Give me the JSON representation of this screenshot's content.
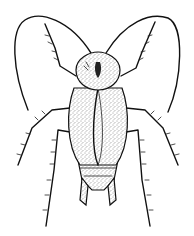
{
  "image": {
    "subject": "cockroach line drawing",
    "style": "black ink stipple illustration",
    "background": "#ffffff",
    "ink": "#111111",
    "view": "dorsal"
  }
}
